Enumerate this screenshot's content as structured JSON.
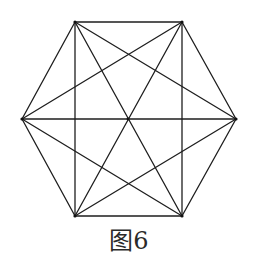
{
  "figure": {
    "caption": "图6",
    "stroke_color": "#1e1e1e",
    "vertices": {
      "A": [
        75,
        22
      ],
      "B": [
        182,
        22
      ],
      "C": [
        236,
        119
      ],
      "D": [
        182,
        216
      ],
      "E": [
        75,
        216
      ],
      "F": [
        22,
        119
      ]
    },
    "center": [
      128,
      119
    ],
    "edges": [
      [
        "A",
        "B"
      ],
      [
        "B",
        "C"
      ],
      [
        "C",
        "D"
      ],
      [
        "D",
        "E"
      ],
      [
        "E",
        "F"
      ],
      [
        "F",
        "A"
      ],
      [
        "A",
        "D"
      ],
      [
        "B",
        "E"
      ],
      [
        "C",
        "F"
      ],
      [
        "A",
        "C"
      ],
      [
        "B",
        "D"
      ],
      [
        "C",
        "E"
      ],
      [
        "D",
        "F"
      ],
      [
        "E",
        "A"
      ],
      [
        "F",
        "B"
      ]
    ]
  }
}
